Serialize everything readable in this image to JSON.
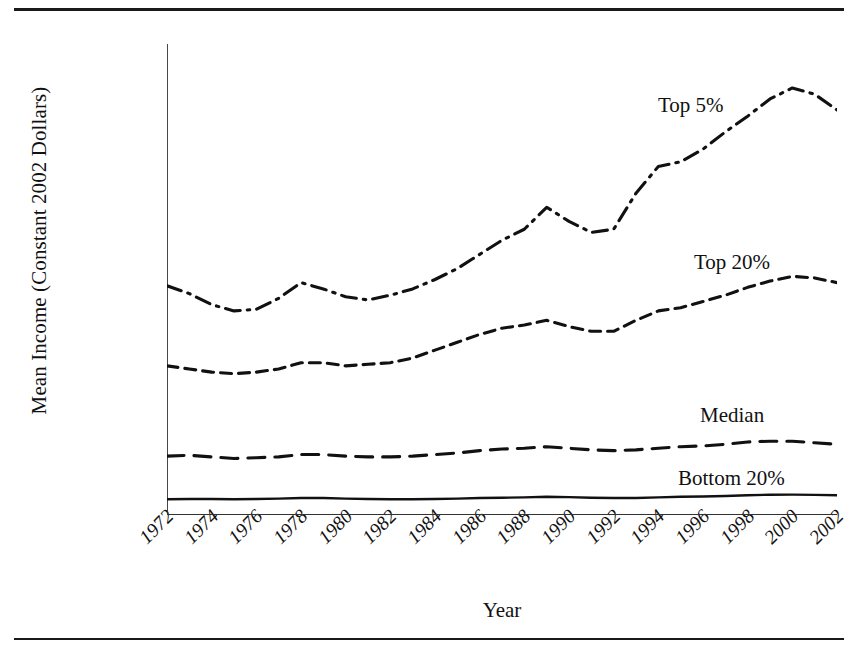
{
  "chart_data": {
    "type": "line",
    "title": "",
    "xlabel": "Year",
    "ylabel": "Mean Income (Constant 2002 Dollars)",
    "xlim": [
      1972,
      2002
    ],
    "ylim": [
      0,
      300000
    ],
    "grid": false,
    "legend_position": "inline-right",
    "x": [
      1972,
      1973,
      1974,
      1975,
      1976,
      1977,
      1978,
      1979,
      1980,
      1981,
      1982,
      1983,
      1984,
      1985,
      1986,
      1987,
      1988,
      1989,
      1990,
      1991,
      1992,
      1993,
      1994,
      1995,
      1996,
      1997,
      1998,
      1999,
      2000,
      2001,
      2002
    ],
    "xtick_labels": [
      "1972",
      "1974",
      "1976",
      "1978",
      "1980",
      "1982",
      "1984",
      "1986",
      "1988",
      "1990",
      "1992",
      "1994",
      "1996",
      "1998",
      "2000",
      "2002"
    ],
    "ytick_labels": [
      "$300,000",
      "$275,000",
      "$250,000",
      "$225,000",
      "$200,000",
      "$175,000",
      "$150,000",
      "$125,000",
      "$100,000",
      "$75,000",
      "$50,000",
      "$25,000",
      "$0"
    ],
    "ytick_values": [
      300000,
      275000,
      250000,
      225000,
      200000,
      175000,
      150000,
      125000,
      100000,
      75000,
      50000,
      25000,
      0
    ],
    "series": [
      {
        "name": "Top 5%",
        "line_style": "dash-dot",
        "color": "#111111",
        "values": [
          146000,
          141000,
          134000,
          130000,
          131000,
          138000,
          148000,
          144000,
          139000,
          137000,
          140000,
          144000,
          150000,
          157000,
          166000,
          175000,
          182000,
          196000,
          187000,
          180000,
          182000,
          205000,
          222000,
          225000,
          233000,
          244000,
          254000,
          265000,
          272000,
          268000,
          258000
        ]
      },
      {
        "name": "Top 20%",
        "line_style": "dashed",
        "color": "#111111",
        "values": [
          95000,
          93000,
          91000,
          90000,
          91000,
          93000,
          97000,
          97000,
          95000,
          96000,
          97000,
          100000,
          105000,
          110000,
          115000,
          119000,
          121000,
          124000,
          120000,
          117000,
          117000,
          124000,
          130000,
          132000,
          136000,
          140000,
          145000,
          149000,
          152000,
          151000,
          148000
        ]
      },
      {
        "name": "Median",
        "line_style": "long-dash",
        "color": "#111111",
        "values": [
          37500,
          38000,
          37000,
          36000,
          36500,
          37000,
          38500,
          38500,
          37500,
          37000,
          37000,
          37500,
          38500,
          39500,
          41000,
          42000,
          42500,
          43500,
          42500,
          41500,
          41000,
          41500,
          42500,
          43500,
          44000,
          45000,
          46500,
          47000,
          47000,
          46000,
          45000
        ]
      },
      {
        "name": "Bottom 20%",
        "line_style": "solid",
        "color": "#111111",
        "values": [
          10000,
          10200,
          10200,
          10000,
          10200,
          10400,
          10800,
          10800,
          10400,
          10200,
          10000,
          10000,
          10200,
          10400,
          10800,
          11000,
          11200,
          11600,
          11400,
          11000,
          10800,
          10800,
          11200,
          11600,
          11800,
          12100,
          12600,
          12900,
          13000,
          12800,
          12600
        ]
      }
    ]
  }
}
